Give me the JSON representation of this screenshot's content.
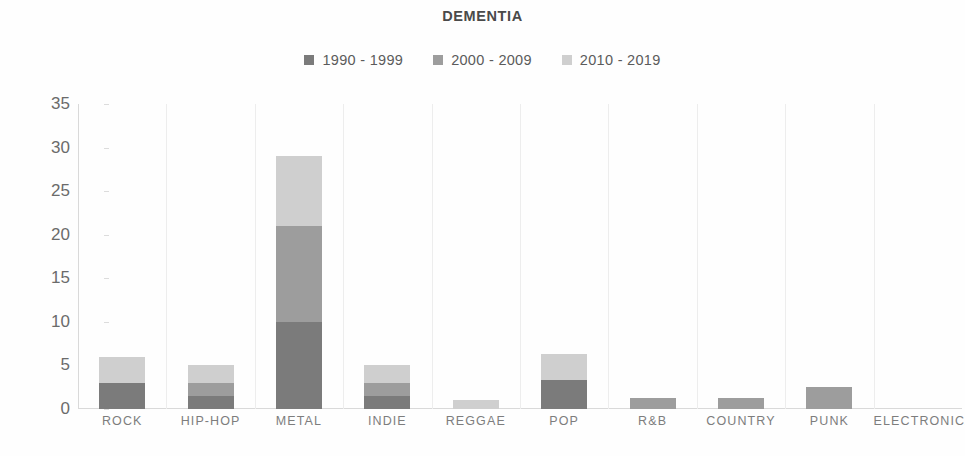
{
  "chart_data": {
    "type": "bar",
    "subtype": "stacked-column",
    "title": "DEMENTIA",
    "xlabel": "",
    "ylabel": "",
    "ylim": [
      0,
      35
    ],
    "yticks": [
      0,
      5,
      10,
      15,
      20,
      25,
      30,
      35
    ],
    "grid": "vertical-category-separators-only",
    "legend_position": "top-center",
    "categories": [
      "ROCK",
      "HIP-HOP",
      "METAL",
      "INDIE",
      "REGGAE",
      "POP",
      "R&B",
      "COUNTRY",
      "PUNK",
      "ELECTRONICA"
    ],
    "series": [
      {
        "name": "1990 - 1999",
        "color": "#7b7b7b",
        "values": [
          3,
          1.5,
          10,
          1.5,
          0,
          3.3,
          0,
          0,
          0,
          0
        ]
      },
      {
        "name": "2000 - 2009",
        "color": "#9d9d9d",
        "values": [
          0,
          1.5,
          11,
          1.5,
          0,
          0,
          1.3,
          1.3,
          2.5,
          0
        ]
      },
      {
        "name": "2010 - 2019",
        "color": "#cfcfcf",
        "values": [
          3,
          2,
          8,
          2,
          1,
          3,
          0,
          0,
          0,
          0
        ]
      }
    ],
    "totals": [
      6,
      5,
      29,
      5,
      1,
      6.3,
      1.3,
      1.3,
      2.5,
      0
    ]
  },
  "colors": {
    "series_1990s": "#7b7b7b",
    "series_2000s": "#9d9d9d",
    "series_2010s": "#cfcfcf",
    "title_text": "#4a4a4a",
    "legend_text": "#5b5b5b",
    "tick_text": "#6b6b6b",
    "xlabel_text": "#7d7d7d",
    "axis_line": "#d9d9d9",
    "gridline": "#ededed",
    "background": "#fefefe"
  }
}
